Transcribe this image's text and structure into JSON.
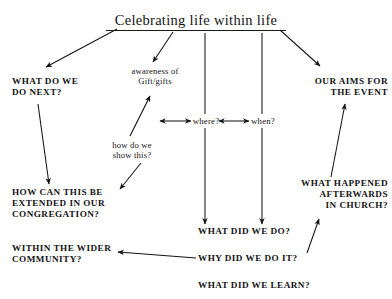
{
  "diagram": {
    "type": "mind-map",
    "title": "Celebrating life within life",
    "background_color": "#ffffff",
    "ink_color": "#141414",
    "nodes": [
      {
        "id": "title",
        "label": "Celebrating life within life",
        "style": "title-underlined"
      },
      {
        "id": "next",
        "label": "WHAT DO WE\nDO NEXT?",
        "style": "caps"
      },
      {
        "id": "awareness",
        "label": "awareness of\nGift/gifts",
        "style": "lowercase"
      },
      {
        "id": "aims",
        "label": "OUR AIMS FOR\nTHE EVENT",
        "style": "caps"
      },
      {
        "id": "where",
        "label": "where?",
        "style": "lowercase"
      },
      {
        "id": "when",
        "label": "when?",
        "style": "lowercase"
      },
      {
        "id": "howshow",
        "label": "how do we\nshow this?",
        "style": "lowercase"
      },
      {
        "id": "extended",
        "label": "HOW CAN THIS BE\nEXTENDED IN OUR\nCONGREGATION?",
        "style": "caps"
      },
      {
        "id": "afterwards",
        "label": "WHAT HAPPENED\nAFTERWARDS\nIN CHURCH?",
        "style": "caps"
      },
      {
        "id": "wider",
        "label": "WITHIN THE WIDER\nCOMMUNITY?",
        "style": "caps"
      },
      {
        "id": "whatdid",
        "label": "WHAT DID WE DO?",
        "style": "caps"
      },
      {
        "id": "whydid",
        "label": "WHY DID WE DO IT?",
        "style": "caps"
      },
      {
        "id": "whatlearn",
        "label": "WHAT DID WE LEARN?",
        "style": "caps"
      }
    ],
    "edges": [
      {
        "from": "title",
        "to": "next",
        "arrow": "single"
      },
      {
        "from": "title",
        "to": "awareness",
        "arrow": "single"
      },
      {
        "from": "title",
        "to": "aims",
        "arrow": "single"
      },
      {
        "from": "title",
        "to": "where",
        "arrow": "none"
      },
      {
        "from": "title",
        "to": "when",
        "arrow": "none"
      },
      {
        "from": "where",
        "to": "when",
        "arrow": "double"
      },
      {
        "from": "where",
        "to": "left",
        "arrow": "double"
      },
      {
        "from": "where",
        "to": "whatdid",
        "arrow": "single"
      },
      {
        "from": "when",
        "to": "whatdid",
        "arrow": "single"
      },
      {
        "from": "next",
        "to": "extended",
        "arrow": "single"
      },
      {
        "from": "howshow",
        "to": "awareness",
        "arrow": "single"
      },
      {
        "from": "howshow",
        "to": "extended",
        "arrow": "single"
      },
      {
        "from": "afterwards",
        "to": "aims",
        "arrow": "single"
      },
      {
        "from": "whydid",
        "to": "afterwards",
        "arrow": "single"
      },
      {
        "from": "whydid",
        "to": "wider",
        "arrow": "single"
      }
    ]
  }
}
